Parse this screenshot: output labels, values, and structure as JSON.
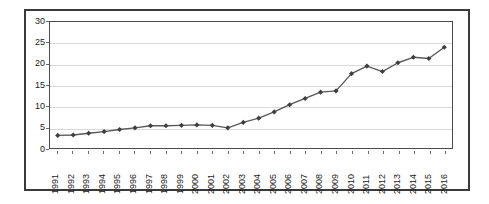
{
  "chart_data": {
    "type": "line",
    "title": "",
    "subtitle": "",
    "xlabel": "",
    "ylabel": "",
    "ylim": [
      0,
      30
    ],
    "ytick_values": [
      0,
      5,
      10,
      15,
      20,
      25,
      30
    ],
    "ytick_labels": [
      "0",
      "5",
      "10",
      "15",
      "20",
      "25",
      "30"
    ],
    "grid": true,
    "legend": false,
    "legend_position": "none",
    "marker": "diamond",
    "line_color": "#595959",
    "marker_color": "#3f3f3f",
    "grid_color": "#d9d9d9",
    "axis_color": "#4a4a4a",
    "categories": [
      "1991",
      "1992",
      "1993",
      "1994",
      "1995",
      "1996",
      "1997",
      "1998",
      "1999",
      "2000",
      "2001",
      "2002",
      "2003",
      "2004",
      "2005",
      "2006",
      "2007",
      "2008",
      "2009",
      "2010",
      "2011",
      "2012",
      "2013",
      "2014",
      "2015",
      "2016"
    ],
    "x": [
      1991,
      1992,
      1993,
      1994,
      1995,
      1996,
      1997,
      1998,
      1999,
      2000,
      2001,
      2002,
      2003,
      2004,
      2005,
      2006,
      2007,
      2008,
      2009,
      2010,
      2011,
      2012,
      2013,
      2014,
      2015,
      2016
    ],
    "values": [
      3.0,
      3.1,
      3.5,
      3.9,
      4.4,
      4.8,
      5.3,
      5.3,
      5.4,
      5.5,
      5.4,
      4.8,
      6.1,
      7.1,
      8.6,
      10.3,
      11.8,
      13.3,
      13.6,
      17.7,
      19.5,
      18.2,
      20.3,
      21.6,
      21.3,
      24.0
    ],
    "series": [
      {
        "name": "Series 1",
        "values": [
          3.0,
          3.1,
          3.5,
          3.9,
          4.4,
          4.8,
          5.3,
          5.3,
          5.4,
          5.5,
          5.4,
          4.8,
          6.1,
          7.1,
          8.6,
          10.3,
          11.8,
          13.3,
          13.6,
          17.7,
          19.5,
          18.2,
          20.3,
          21.6,
          21.3,
          24.0
        ]
      }
    ]
  }
}
